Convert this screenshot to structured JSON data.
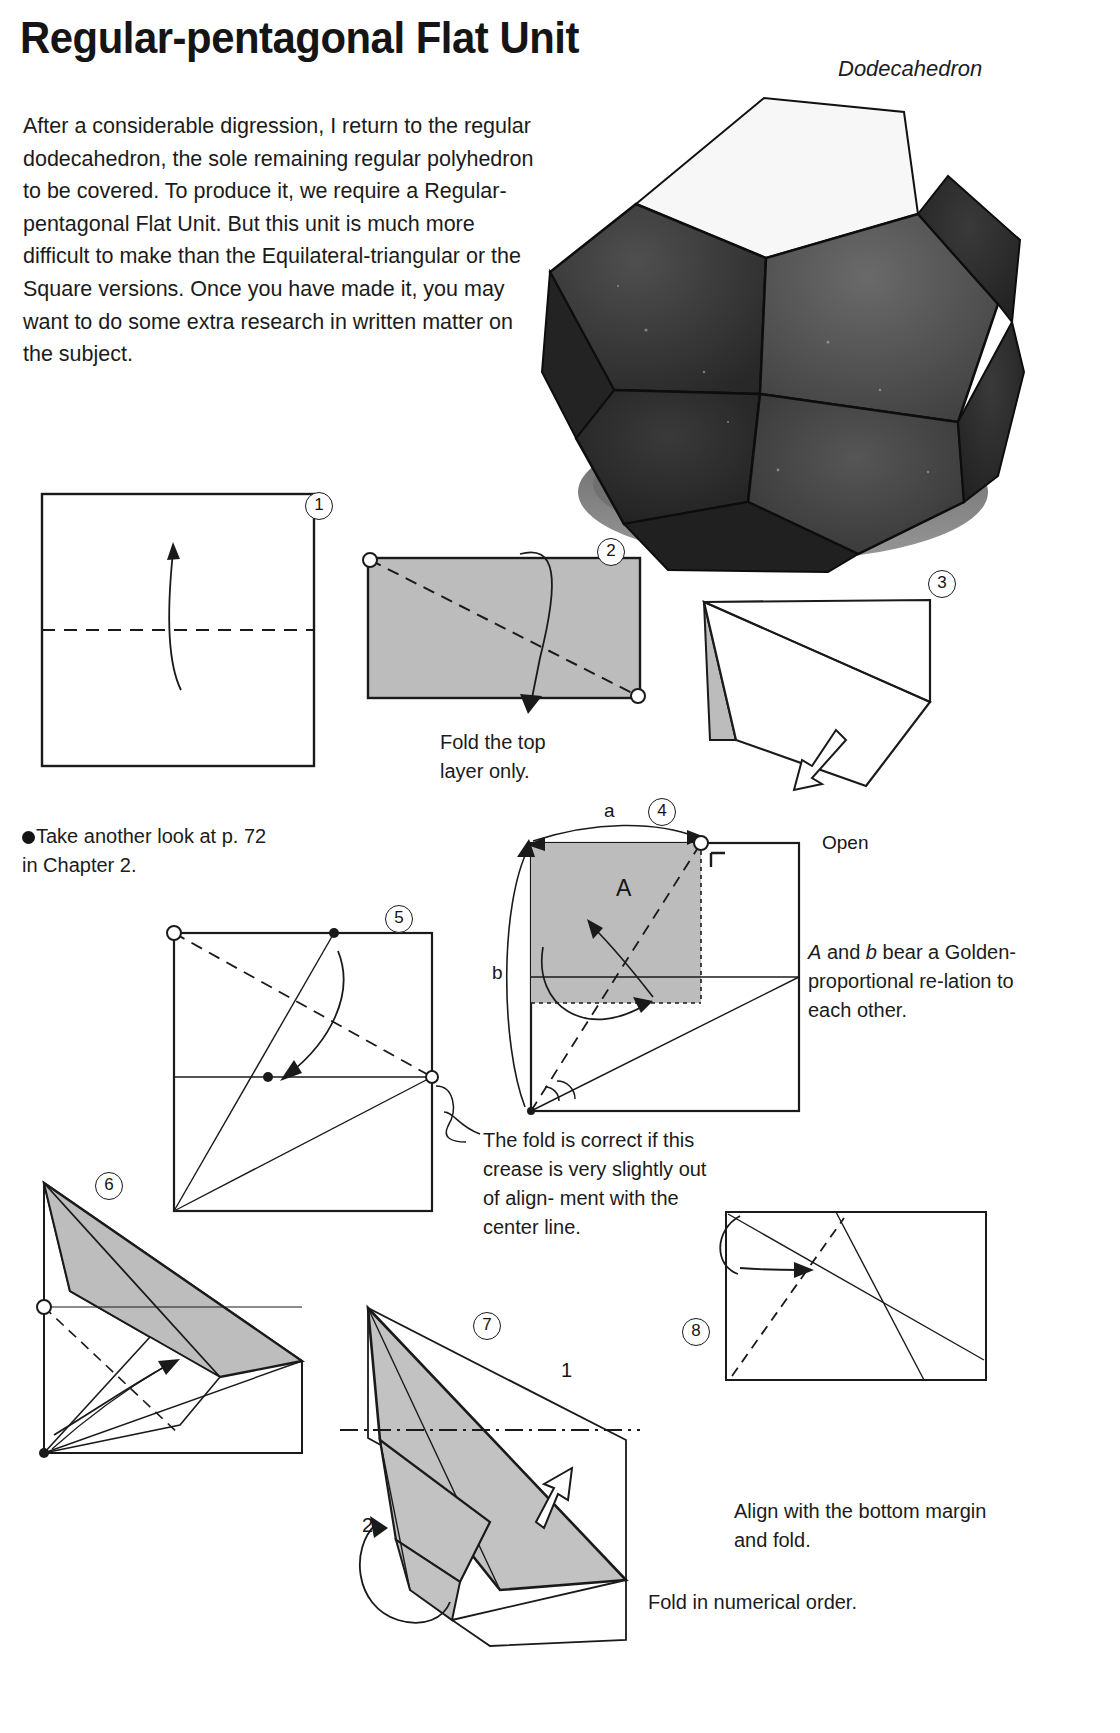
{
  "header": {
    "title": "Regular-pentagonal Flat Unit",
    "subtitle": "Dodecahedron"
  },
  "intro": {
    "paragraph": "After a considerable digression, I return to the regular dodecahedron, the sole remaining regular polyhedron to be covered. To produce it, we require a Regular-pentagonal Flat Unit. But this unit is much more difficult to make than the Equilateral-triangular or the Square versions. Once you have made it, you may want to do some extra research in written matter on the subject."
  },
  "notes": {
    "see_also_line1": "Take another look at p. 72",
    "see_also_line2": "in Chapter 2.",
    "fold_top_layer": "Fold the top\nlayer only.",
    "open": "Open",
    "golden": "A and b bear a Golden-proportional relation to each other.",
    "golden_lines": [
      "A and b bear a",
      "Golden-",
      "proportional re-",
      "lation to each",
      "other."
    ],
    "crease_check_lines": [
      "The fold is correct if",
      "this crease is very",
      "slightly out of align-",
      "ment with the center",
      "line."
    ],
    "align_bottom_lines": [
      "Align with the bottom",
      "margin and fold."
    ],
    "numerical_order": "Fold in numerical order."
  },
  "steps": [
    {
      "num": "1",
      "label": "①"
    },
    {
      "num": "2",
      "label": "②"
    },
    {
      "num": "3",
      "label": "③"
    },
    {
      "num": "4",
      "label": "④"
    },
    {
      "num": "5",
      "label": "⑤"
    },
    {
      "num": "6",
      "label": "⑥"
    },
    {
      "num": "7",
      "label": "⑦"
    },
    {
      "num": "8",
      "label": "⑧"
    }
  ],
  "diagram_labels": {
    "a": "a",
    "b": "b",
    "A": "A",
    "order_1": "1",
    "order_2": "2"
  },
  "colors": {
    "paper_shade": "#b9b9b9",
    "ink": "#1a1a1a",
    "background": "#ffffff"
  }
}
